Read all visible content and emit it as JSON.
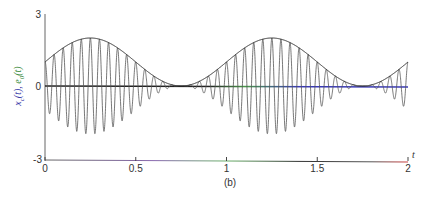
{
  "chart_data": {
    "type": "line",
    "title": "",
    "caption": "(b)",
    "xlabel": "t",
    "ylabel_parts": [
      {
        "text": "x",
        "sub": "c",
        "arg": "(t), ",
        "color": "#3a3aa8"
      },
      {
        "text": "e",
        "sub": "0",
        "arg": "(t)",
        "color": "#3a8a3a"
      }
    ],
    "xlim": [
      0,
      2
    ],
    "ylim": [
      -3,
      3
    ],
    "x_ticks": [
      "0",
      "0.5",
      "1",
      "1.5",
      "2"
    ],
    "x_tick_values": [
      0,
      0.5,
      1,
      1.5,
      2
    ],
    "y_ticks": [
      "3",
      "0",
      "-3"
    ],
    "y_tick_values": [
      3,
      0,
      -3
    ],
    "grid": false,
    "legend": null,
    "series": [
      {
        "name": "x_c(t)",
        "description": "AM signal e0(t)*cos(2*pi*20*t)",
        "formula": "(1 + sin(2*pi*t)) * cos(2*pi*20*t)",
        "carrier_hz": 20,
        "color": "#555555"
      },
      {
        "name": "e0(t)",
        "description": "envelope",
        "formula": "1 + sin(2*pi*t)",
        "x": [
          0,
          0.25,
          0.5,
          0.75,
          1.0,
          1.25,
          1.5,
          1.75,
          2.0
        ],
        "values": [
          1,
          2,
          1,
          0,
          1,
          2,
          1,
          0,
          1
        ],
        "color": "#222222"
      }
    ],
    "axis_colors": {
      "zero_line": [
        "#222222",
        "#3a8a3a",
        "#3a3ab8"
      ],
      "x_axis": [
        "#555555",
        "#8a5aa8",
        "#5aa85a",
        "#333333",
        "#d04040"
      ]
    }
  }
}
